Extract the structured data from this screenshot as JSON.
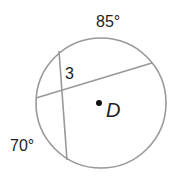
{
  "diagram": {
    "type": "circle-chords",
    "circle": {
      "center_label": "D",
      "cx": 101,
      "cy": 103,
      "r": 65,
      "stroke": "#999999"
    },
    "chords": [
      {
        "name": "chord-horizontal",
        "x1": 36,
        "y1": 98,
        "x2": 152,
        "y2": 63
      },
      {
        "name": "chord-vertical",
        "x1": 59,
        "y1": 51,
        "x2": 67,
        "y2": 160
      }
    ],
    "labels": {
      "arc_top": "85°",
      "arc_left": "70°",
      "angle": "3",
      "center": "D"
    }
  }
}
